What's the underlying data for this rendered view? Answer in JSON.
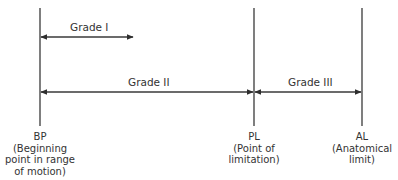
{
  "diagram": {
    "type": "range-of-motion-grades",
    "markers": [
      {
        "id": "bp",
        "abbr": "BP",
        "description": "(Beginning point in range of motion)",
        "desc_lines": [
          "(Beginning",
          "point in range",
          "of motion)"
        ],
        "x": 40
      },
      {
        "id": "pl",
        "abbr": "PL",
        "description": "(Point of limitation)",
        "desc_lines": [
          "(Point of",
          "limitation)"
        ],
        "x": 254
      },
      {
        "id": "al",
        "abbr": "AL",
        "description": "(Anatomical limit)",
        "desc_lines": [
          "(Anatomical",
          "limit)"
        ],
        "x": 362
      }
    ],
    "grades": [
      {
        "label": "Grade I",
        "from": "BP",
        "to": "mid-range",
        "x1": 40,
        "x2": 133,
        "y": 37
      },
      {
        "label": "Grade II",
        "from": "BP",
        "to": "PL",
        "x1": 40,
        "x2": 254,
        "y": 92
      },
      {
        "label": "Grade III",
        "from": "PL",
        "to": "AL",
        "x1": 254,
        "x2": 362,
        "y": 92
      }
    ],
    "colors": {
      "line": "#3a3a3a",
      "text": "#333333",
      "background": "#ffffff"
    }
  }
}
